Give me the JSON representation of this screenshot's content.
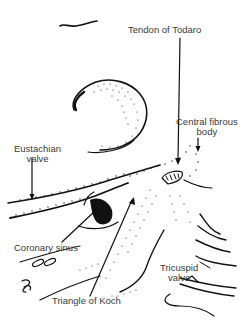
{
  "figure": {
    "labels": {
      "tendon_of_todaro": "Tendon of Todaro",
      "central_fibrous_body_line1": "Central fibrous",
      "central_fibrous_body_line2": "body",
      "eustachian_valve_line1": "Eustachian",
      "eustachian_valve_line2": "valve",
      "coronary_sinus": "Coronary sinus",
      "tricuspid_valve_line1": "Tricuspid",
      "tricuspid_valve_line2": "valve",
      "triangle_of_koch": "Triangle of Koch"
    },
    "colors": {
      "ink": "#111111",
      "label_text": "#3a3a3a",
      "background": "#ffffff"
    }
  }
}
